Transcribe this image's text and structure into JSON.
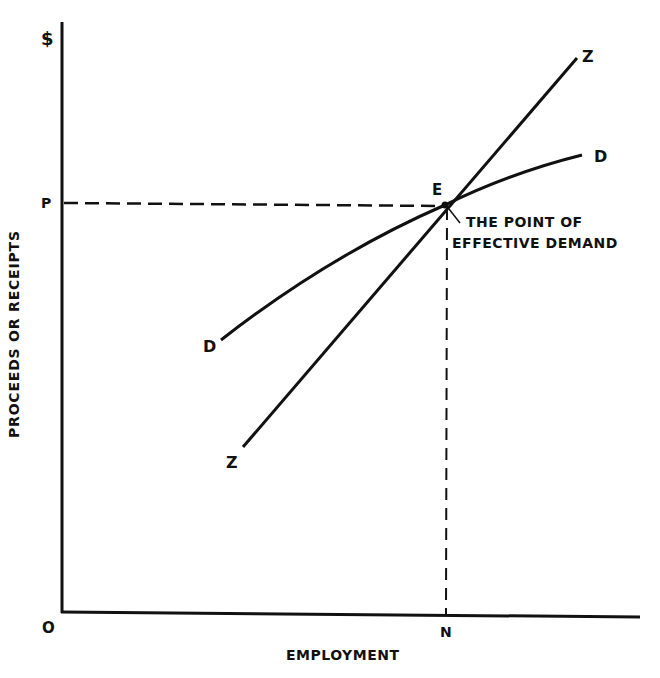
{
  "diagram": {
    "title": "",
    "axes": {
      "y_unit": "$",
      "y_title": "PROCEEDS OR RECEIPTS",
      "x_title": "EMPLOYMENT",
      "origin": "O",
      "y_tick": "P",
      "x_tick": "N"
    },
    "curves": [
      {
        "name": "D",
        "label_start": "D",
        "label_end": "D",
        "description": "aggregate demand function (concave)"
      },
      {
        "name": "Z",
        "label_start": "Z",
        "label_end": "Z",
        "description": "aggregate supply function (linear, steeper)"
      }
    ],
    "intersection": {
      "label": "E",
      "annotation_line1": "THE POINT OF",
      "annotation_line2": "EFFECTIVE DEMAND"
    },
    "colors": {
      "ink": "#111111",
      "background": "#ffffff"
    }
  }
}
